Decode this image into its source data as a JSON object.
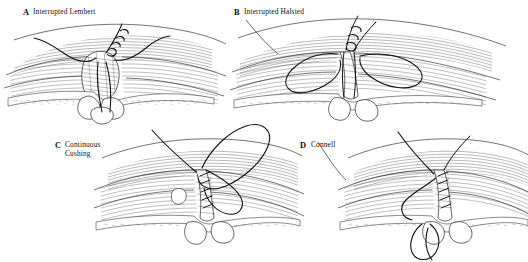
{
  "figure": {
    "background_color": "#ffffff",
    "ink_color": "#1a1a1a",
    "width": 528,
    "height": 262,
    "panel_count": 4
  },
  "panels": [
    {
      "id": "a",
      "letter": "A",
      "label": "Interrupted Lembert",
      "label_lines": [
        "Interrupted Lembert"
      ],
      "letter_x": 23,
      "letter_y": 8,
      "label_x": 33,
      "label_y": 8,
      "technique": "interrupted-lembert",
      "description": "Interrupted Lembert seromuscular suture inverting the bowel wall",
      "suture_count": 1,
      "knot_count": 1
    },
    {
      "id": "b",
      "letter": "B",
      "label": "Interrupted Halsted",
      "label_lines": [
        "Interrupted Halsted"
      ],
      "letter_x": 234,
      "letter_y": 8,
      "label_x": 244,
      "label_y": 8,
      "technique": "interrupted-halsted",
      "description": "Interrupted Halsted horizontal mattress suture with paired loops",
      "suture_count": 2,
      "knot_count": 1
    },
    {
      "id": "c",
      "letter": "C",
      "label": "Continuous Cushing",
      "label_lines": [
        "Continuous",
        "Cushing"
      ],
      "letter_x": 55,
      "letter_y": 141,
      "label_x": 65,
      "label_y": 141,
      "technique": "continuous-cushing",
      "description": "Continuous Cushing suture running parallel to the incision line",
      "suture_count": 1,
      "knot_count": 0
    },
    {
      "id": "d",
      "letter": "D",
      "label": "Connell",
      "label_lines": [
        "Connell"
      ],
      "letter_x": 300,
      "letter_y": 141,
      "label_x": 311,
      "label_y": 141,
      "technique": "connell",
      "description": "Connell continuous inverting suture passing full thickness through the bowel wall",
      "suture_count": 1,
      "knot_count": 0
    }
  ],
  "render": {
    "hatch_color": "#2b2b2b",
    "thread_color": "#111111",
    "mucosa_color": "#4a4a4a",
    "line_weight_fine": 0.35,
    "line_weight_thread": 1.15
  }
}
